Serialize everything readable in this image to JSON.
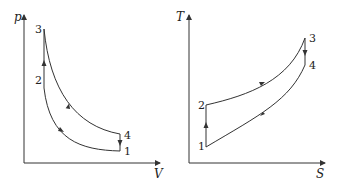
{
  "diagrams": [
    {
      "name": "pV-diagram",
      "axes": {
        "y_label": "p",
        "x_label": "V"
      },
      "points": [
        {
          "label": "1"
        },
        {
          "label": "2"
        },
        {
          "label": "3"
        },
        {
          "label": "4"
        }
      ]
    },
    {
      "name": "TS-diagram",
      "axes": {
        "y_label": "T",
        "x_label": "S"
      },
      "points": [
        {
          "label": "1"
        },
        {
          "label": "2"
        },
        {
          "label": "3"
        },
        {
          "label": "4"
        }
      ]
    }
  ],
  "colors": {
    "line": "#333333",
    "background": "#ffffff"
  }
}
